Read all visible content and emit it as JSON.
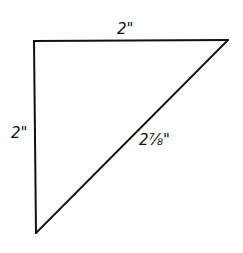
{
  "diagram": {
    "type": "right-triangle",
    "vertices": {
      "top_left": [
        34,
        41
      ],
      "top_right": [
        228,
        40
      ],
      "bottom_left": [
        36,
        233
      ]
    },
    "stroke_color": "#111111",
    "background": "#ffffff",
    "labels": {
      "top_side": "2\"",
      "left_side": "2\"",
      "hypotenuse": "2⅞\""
    }
  }
}
